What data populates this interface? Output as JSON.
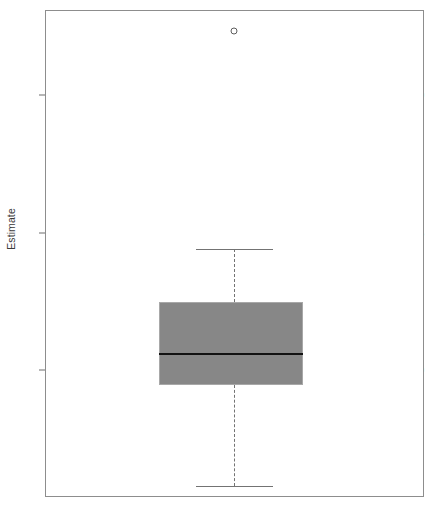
{
  "figure": {
    "width": 432,
    "height": 505,
    "background": "#ffffff",
    "frame_color": "#8d8d8d"
  },
  "axis": {
    "y_title": "Estimate",
    "tick_labels": [
      "1.0",
      "0.5",
      "0.0"
    ],
    "tick_values": [
      1.0,
      0.5,
      0.0
    ],
    "text_color": "#3a3a3a"
  },
  "colors": {
    "box_fill": "#878787",
    "box_border": "#a8a8a8",
    "median": "#121212",
    "whisker": "#737373",
    "outlier": "#5d5d5d"
  },
  "chart_data": {
    "type": "box",
    "title": "",
    "xlabel": "",
    "ylabel": "Estimate",
    "grid": false,
    "legend": null,
    "ylim": [
      -0.45,
      1.31
    ],
    "yticks": [
      0.0,
      0.5,
      1.0
    ],
    "ytick_labels": [
      "0.0",
      "0.5",
      "1.0"
    ],
    "categories": [
      ""
    ],
    "boxes": [
      {
        "name": "Estimate",
        "whisker_low": -0.422,
        "q1": -0.055,
        "median": 0.058,
        "q3": 0.247,
        "whisker_high": 0.44,
        "outliers": [
          1.233
        ],
        "fill": "#878787"
      }
    ]
  },
  "geometry": {
    "plot_left": 45,
    "plot_top": 10,
    "plot_width": 379,
    "plot_height": 487,
    "y_for_1": 95,
    "y_for_0": 370,
    "px_per_unit": 275,
    "box_left": 159,
    "box_right": 303,
    "cap_left": 196,
    "cap_right": 273,
    "center_x": 234,
    "box_top_y": 302,
    "box_bottom_y": 385,
    "median_y": 354,
    "cap_high_y": 249,
    "cap_low_y": 486,
    "outlier_y": 31
  }
}
